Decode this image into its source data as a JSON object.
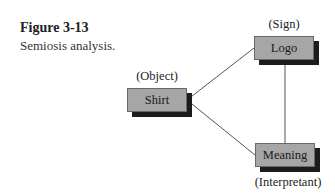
{
  "caption": {
    "title": "Figure 3-13",
    "text": "Semiosis analysis."
  },
  "diagram": {
    "nodes": [
      {
        "id": "sign",
        "label": "Logo",
        "role": "(Sign)"
      },
      {
        "id": "object",
        "label": "Shirt",
        "role": "(Object)"
      },
      {
        "id": "interpretant",
        "label": "Meaning",
        "role": "(Interpretant)"
      }
    ],
    "edges": [
      {
        "from": "object",
        "to": "sign"
      },
      {
        "from": "object",
        "to": "interpretant"
      },
      {
        "from": "sign",
        "to": "interpretant"
      }
    ],
    "colors": {
      "box_fill": "#a6a6a6",
      "box_shadow": "#1c1c1c",
      "line": "#555555"
    }
  }
}
